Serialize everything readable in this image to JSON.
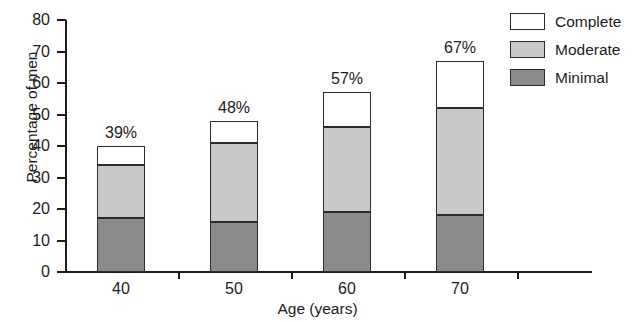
{
  "chart_data": {
    "type": "bar",
    "subtype": "stacked-bar",
    "title": "",
    "xlabel": "Age (years)",
    "ylabel": "Percentage of men",
    "categories": [
      "40",
      "50",
      "60",
      "70"
    ],
    "ylim": [
      0,
      80
    ],
    "yticks": [
      0,
      10,
      20,
      30,
      40,
      50,
      60,
      70,
      80
    ],
    "ytick_labels": [
      "0",
      "10",
      "20",
      "30",
      "40",
      "50",
      "60",
      "70",
      "80"
    ],
    "grid": false,
    "legend_position": "top-right",
    "series": [
      {
        "name": "Minimal",
        "color": "#8a8a8a",
        "values": [
          17,
          16,
          19,
          18
        ]
      },
      {
        "name": "Moderate",
        "color": "#c9c9c9",
        "values": [
          17,
          25,
          27,
          34
        ]
      },
      {
        "name": "Complete",
        "color": "#ffffff",
        "values": [
          6,
          7,
          11,
          15
        ]
      }
    ],
    "totals": [
      39,
      48,
      57,
      67
    ],
    "total_labels": [
      "39%",
      "48%",
      "57%",
      "67%"
    ],
    "cumulative_tops": [
      {
        "minimal": 17,
        "moderate": 34,
        "complete": 40
      },
      {
        "minimal": 16,
        "moderate": 41,
        "complete": 48
      },
      {
        "minimal": 19,
        "moderate": 46,
        "complete": 57
      },
      {
        "minimal": 18,
        "moderate": 52,
        "complete": 67
      }
    ]
  },
  "legend": {
    "items": [
      {
        "label": "Complete",
        "color": "#ffffff"
      },
      {
        "label": "Moderate",
        "color": "#c9c9c9"
      },
      {
        "label": "Minimal",
        "color": "#8a8a8a"
      }
    ]
  },
  "axes": {
    "y_title": "Percentage of men",
    "x_title": "Age (years)"
  }
}
